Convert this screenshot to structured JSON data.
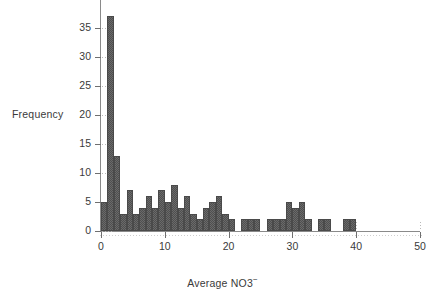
{
  "chart_data": {
    "type": "bar",
    "title": "",
    "subtitle": "",
    "xlabel": "Average NO3",
    "xlabel_superscript": "−",
    "ylabel": "Frequency",
    "xlim": [
      0,
      50
    ],
    "ylim": [
      0,
      38
    ],
    "grid": false,
    "legend": null,
    "bin_width": 1,
    "xticks": [
      0,
      10,
      20,
      30,
      40,
      50
    ],
    "xtick_labels": [
      "0",
      "10",
      "20",
      "30",
      "40",
      "50"
    ],
    "yticks": [
      0,
      5,
      10,
      15,
      20,
      25,
      30,
      35
    ],
    "ytick_labels": [
      "0",
      "5",
      "10",
      "15",
      "20",
      "25",
      "30",
      "35"
    ],
    "note_axis_clipped_top": "y axis extends above 35 tick; top of frame cut off",
    "bar_color": "#6a6a6a",
    "bar_edge_color": "#4a4a4a",
    "axis_color": "#8a8a8a",
    "text_color": "#3a3a3a",
    "categories": [
      "1",
      "2",
      "3",
      "4",
      "5",
      "6",
      "7",
      "8",
      "9",
      "10",
      "11",
      "12",
      "13",
      "14",
      "15",
      "16",
      "17",
      "18",
      "19",
      "20",
      "21",
      "22",
      "23",
      "24",
      "25",
      "26",
      "27",
      "28",
      "29",
      "30",
      "31",
      "32",
      "33",
      "34",
      "35",
      "36",
      "37",
      "38",
      "39",
      "40",
      "41",
      "42",
      "43",
      "44",
      "45",
      "46",
      "47",
      "48",
      "49",
      "50"
    ],
    "values": [
      5,
      37,
      13,
      3,
      7,
      3,
      4,
      6,
      4,
      7,
      5,
      8,
      4,
      6,
      3,
      2,
      4,
      5,
      6,
      3,
      2,
      0,
      2,
      2,
      2,
      0,
      2,
      2,
      2,
      5,
      4,
      5,
      2,
      0,
      2,
      2,
      0,
      0,
      2,
      2,
      0,
      0,
      0,
      0,
      0,
      0,
      0,
      0,
      0,
      0
    ],
    "series": [
      {
        "name": "Frequency",
        "values": [
          5,
          37,
          13,
          3,
          7,
          3,
          4,
          6,
          4,
          7,
          5,
          8,
          4,
          6,
          3,
          2,
          4,
          5,
          6,
          3,
          2,
          0,
          2,
          2,
          2,
          0,
          2,
          2,
          2,
          5,
          4,
          5,
          2,
          0,
          2,
          2,
          0,
          0,
          2,
          2,
          0,
          0,
          0,
          0,
          0,
          0,
          0,
          0,
          0,
          0
        ]
      }
    ]
  },
  "geometry": {
    "plot_left_px": 101,
    "plot_right_px": 420,
    "plot_baseline_px": 231,
    "px_per_x_unit": 6.38,
    "px_per_y_unit": 5.8
  }
}
